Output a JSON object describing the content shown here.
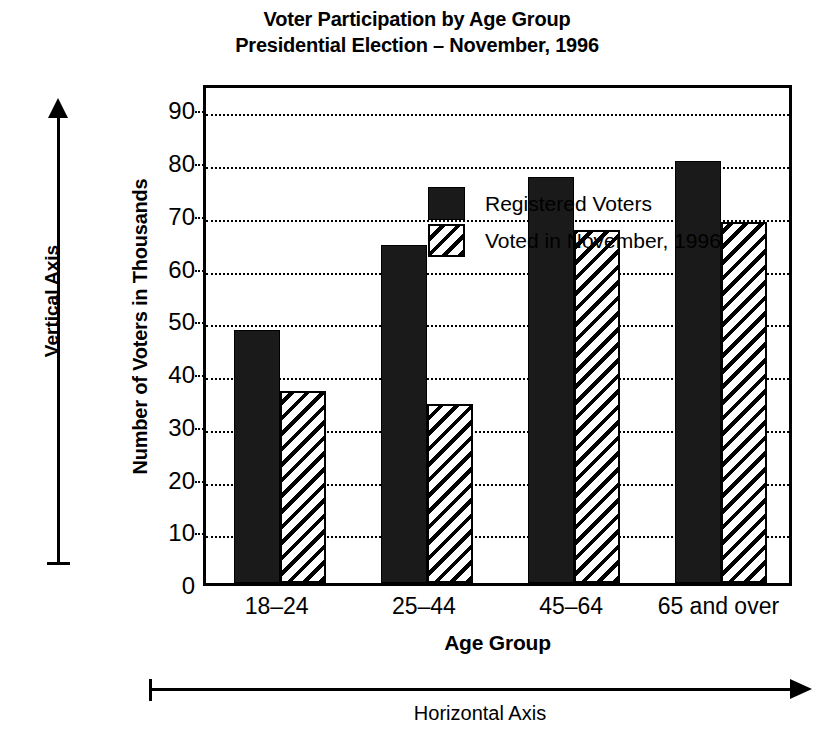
{
  "chart_data": {
    "type": "bar",
    "title": "Voter Participation by Age Group",
    "subtitle": "Presidential Election – November, 1996",
    "title_lines": [
      "Voter Participation by Age Group",
      "Presidential Election – November, 1996"
    ],
    "xlabel": "Age Group",
    "ylabel": "Number of Voters in Thousands",
    "ylim": [
      0,
      95
    ],
    "ytick_values": [
      0,
      10,
      20,
      30,
      40,
      50,
      60,
      70,
      80,
      90
    ],
    "ytick_labels": [
      "0",
      "10",
      "20",
      "30",
      "40",
      "50",
      "60",
      "70",
      "80",
      "90"
    ],
    "grid": "horizontal-dotted",
    "legend_position": "top-left-inside",
    "categories": [
      "18–24",
      "25–44",
      "45–64",
      "65 and over"
    ],
    "series": [
      {
        "name": "Registered Voters",
        "fill": "solid-black",
        "values": [
          48,
          64,
          77,
          80
        ]
      },
      {
        "name": "Voted in November, 1996",
        "fill": "diagonal-hatch",
        "values": [
          36.5,
          34,
          67,
          68.5
        ]
      }
    ],
    "annotations": {
      "vertical_axis": "Vertical Axis",
      "horizontal_axis": "Horizontal Axis"
    },
    "colors": {
      "ink": "#000000",
      "background": "#ffffff",
      "registered_fill": "#1a1a1a"
    }
  },
  "legend": {
    "items": [
      {
        "label": "Registered Voters"
      },
      {
        "label": "Voted in November, 1996"
      }
    ]
  }
}
